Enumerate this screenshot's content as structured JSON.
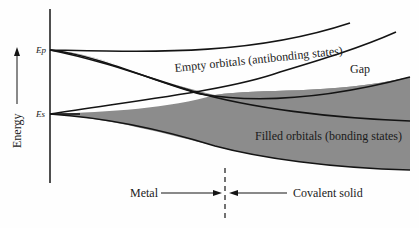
{
  "diagram": {
    "axis_label": "Energy",
    "levels": {
      "ep_label": "Ep",
      "es_label": "Es"
    },
    "regions": {
      "empty_label": "Empty orbitals (antibonding states)",
      "gap_label": "Gap",
      "filled_label": "Filled orbitals (bonding states)"
    },
    "bottom": {
      "metal_label": "Metal",
      "covalent_label": "Covalent solid"
    },
    "colors": {
      "band_fill": "#8c8c8c",
      "line": "#141414",
      "background": "#fefefe"
    }
  }
}
